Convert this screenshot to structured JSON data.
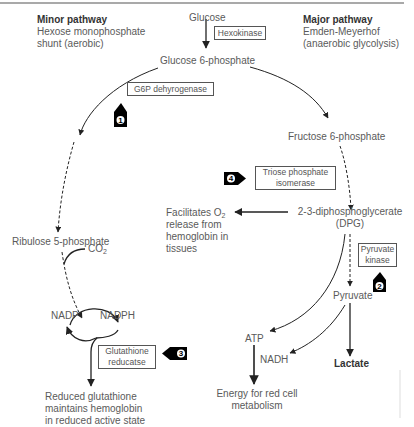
{
  "minor_pathway": {
    "title": "Minor pathway",
    "line1": "Hexose monophosphate",
    "line2": "shunt (aerobic)"
  },
  "major_pathway": {
    "title": "Major pathway",
    "line1": "Emden-Meyerhof",
    "line2": "(anaerobic glycolysis)"
  },
  "nodes": {
    "glucose": "Glucose",
    "glucose6p": "Glucose 6-phosphate",
    "fructose6p": "Fructose 6-phosphate",
    "dpg_line1": "2-3-diphosphoglycerate",
    "dpg_line2": "(DPG)",
    "pyruvate": "Pyruvate",
    "lactate": "Lactate",
    "atp": "ATP",
    "nadh": "NADH",
    "energy_line1": "Energy for red cell",
    "energy_line2": "metabolism",
    "ribulose5p": "Ribulose 5-phosphate",
    "co2_main": "CO",
    "co2_sub": "2",
    "nadp": "NADP",
    "nadph": "NADPH",
    "facilitates_line1_main": "Facilitates O",
    "facilitates_line1_sub": "2",
    "facilitates_line2": "release from",
    "facilitates_line3": "hemoglobin in",
    "facilitates_line4": "tissues",
    "glutathione_line1": "Reduced glutathione",
    "glutathione_line2": "maintains hemoglobin",
    "glutathione_line3": "in reduced active state"
  },
  "enzymes": {
    "hexokinase": "Hexokinase",
    "g6p_dehydrogenase": "G6P dehyrogenase",
    "triose_line1": "Triose phosphate",
    "triose_line2": "isomerase",
    "pyruvate_kinase_line1": "Pyruvate",
    "pyruvate_kinase_line2": "kinase",
    "glutathione_reductase_line1": "Glutathione",
    "glutathione_reductase_line2": "reducatse"
  },
  "markers": {
    "m1": "1",
    "m2": "2",
    "m3": "3",
    "m4": "4"
  },
  "colors": {
    "line": "#333333",
    "text": "#5a5a5a",
    "marker": "#000000"
  }
}
